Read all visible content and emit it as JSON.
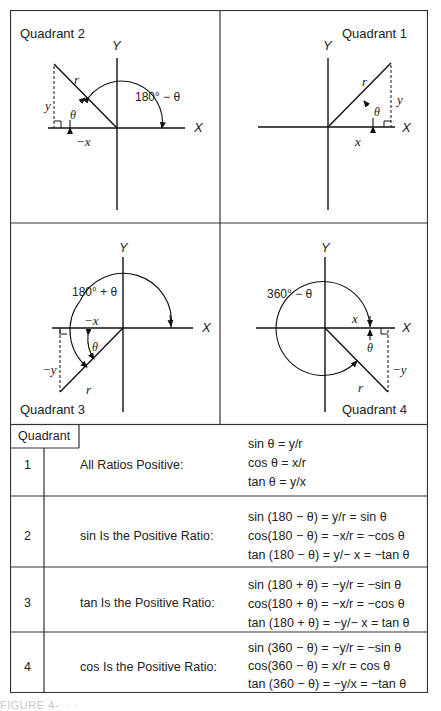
{
  "quadrants": [
    {
      "id": 2,
      "label": "Quadrant  2",
      "angle_label": "180° − θ",
      "axis_x": "X",
      "axis_y": "Y",
      "side_h": "−x",
      "side_v": "y",
      "hyp": "r",
      "theta": "θ"
    },
    {
      "id": 1,
      "label": "Quadrant  1",
      "axis_x": "X",
      "axis_y": "Y",
      "side_h": "x",
      "side_v": "y",
      "hyp": "r",
      "theta": "θ"
    },
    {
      "id": 3,
      "label": "Quadrant  3",
      "angle_label": "180° + θ",
      "axis_x": "X",
      "axis_y": "Y",
      "side_h": "−x",
      "side_v": "−y",
      "hyp": "r",
      "theta": "θ"
    },
    {
      "id": 4,
      "label": "Quadrant  4",
      "angle_label": "360° − θ",
      "axis_x": "X",
      "axis_y": "Y",
      "side_h": "x",
      "side_v": "−y",
      "hyp": "r",
      "theta": "θ"
    }
  ],
  "table": {
    "header": "Quadrant",
    "rows": [
      {
        "quadrant": "1",
        "rule": "All Ratios Positive:",
        "equations": [
          "sin  θ = y/r",
          "cos θ = x/r",
          "tan θ = y/x"
        ]
      },
      {
        "quadrant": "2",
        "rule": "sin Is the Positive Ratio:",
        "equations": [
          "sin (180 − θ) = y/r = sin θ",
          "cos(180 − θ) = −x/r = −cos θ",
          "tan (180 − θ) = y/− x = −tan θ"
        ]
      },
      {
        "quadrant": "3",
        "rule": "tan Is the Positive Ratio:",
        "equations": [
          "sin (180 + θ) = −y/r = −sin θ",
          "cos(180 + θ) = −x/r = −cos θ",
          "tan (180 + θ) = −y/− x = tan θ"
        ]
      },
      {
        "quadrant": "4",
        "rule": "cos Is the Positive Ratio:",
        "equations": [
          "sin (360 − θ) = −y/r = −sin θ",
          "cos(360 − θ) = x/r = cos θ",
          "tan (360 − θ) = −y/x = −tan θ"
        ]
      }
    ]
  },
  "caption_partial": "FIGURE 4-·  ·  ·"
}
